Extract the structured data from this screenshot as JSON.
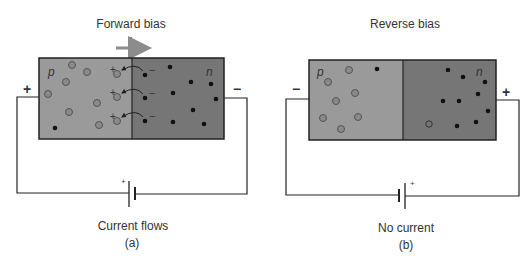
{
  "colors": {
    "p_region": "#9a9a9a",
    "n_region": "#767676",
    "hole_fill": "#8a8a8a",
    "electron": "#111111",
    "wire": "#222222",
    "arrow": "#8c8c8c"
  },
  "diagram_a": {
    "title": "Forward bias",
    "current_symbol": "I",
    "p_label": "p",
    "n_label": "n",
    "left_terminal": "+",
    "right_terminal": "−",
    "battery_plus": "+",
    "caption": "Current flows",
    "sublabel": "(a)",
    "junction_charges": {
      "hole_sign": "+",
      "electron_sign": "−"
    }
  },
  "diagram_b": {
    "title": "Reverse bias",
    "p_label": "p",
    "n_label": "n",
    "left_terminal": "−",
    "right_terminal": "+",
    "battery_plus": "+",
    "caption": "No current",
    "sublabel": "(b)"
  }
}
